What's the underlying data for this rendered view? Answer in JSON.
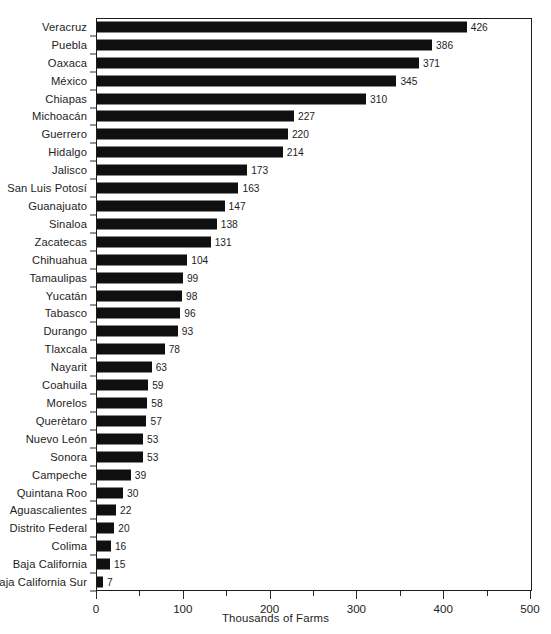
{
  "chart_data": {
    "type": "bar",
    "orientation": "horizontal",
    "title": "",
    "xlabel": "Thousands of Farms",
    "ylabel": "",
    "xlim": [
      0,
      500
    ],
    "xticks": [
      0,
      100,
      200,
      300,
      400,
      500
    ],
    "xtick_labels": [
      "0",
      "100",
      "200",
      "300",
      "400",
      "500"
    ],
    "minor_xticks": [
      50,
      150,
      250,
      350,
      450
    ],
    "grid": false,
    "legend": null,
    "bar_color": "#101010",
    "axis_color": "#1c1c1c",
    "value_labels": true,
    "categories": [
      "Veracruz",
      "Puebla",
      "Oaxaca",
      "México",
      "Chiapas",
      "Michoacán",
      "Guerrero",
      "Hidalgo",
      "Jalisco",
      "San Luis Potosí",
      "Guanajuato",
      "Sinaloa",
      "Zacatecas",
      "Chihuahua",
      "Tamaulipas",
      "Yucatán",
      "Tabasco",
      "Durango",
      "Tlaxcala",
      "Nayarit",
      "Coahuila",
      "Morelos",
      "Querètaro",
      "Nuevo León",
      "Sonora",
      "Campeche",
      "Quintana Roo",
      "Aguascalientes",
      "Distrito Federal",
      "Colima",
      "Baja California",
      "Baja California Sur"
    ],
    "values": [
      426,
      386,
      371,
      345,
      310,
      227,
      220,
      214,
      173,
      163,
      147,
      138,
      131,
      104,
      99,
      98,
      96,
      93,
      78,
      63,
      59,
      58,
      57,
      53,
      53,
      39,
      30,
      22,
      20,
      16,
      15,
      7
    ],
    "value_label_text": [
      "426",
      "386",
      "371",
      "345",
      "310",
      "227",
      "220",
      "214",
      "173",
      "163",
      "147",
      "138",
      "131",
      "104",
      "99",
      "98",
      "96",
      "93",
      "78",
      "63",
      "59",
      "58",
      "57",
      "53",
      "53",
      "39",
      "30",
      "22",
      "20",
      "16",
      "15",
      "7"
    ]
  }
}
